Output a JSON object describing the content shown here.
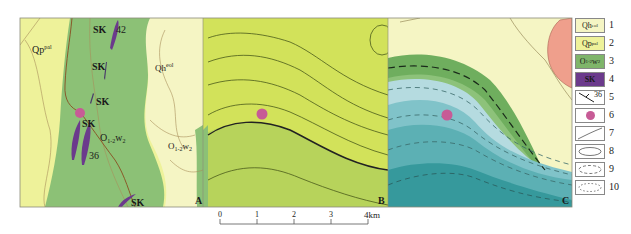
{
  "panels": [
    {
      "id": "A",
      "label": "A"
    },
    {
      "id": "B",
      "label": "B"
    },
    {
      "id": "C",
      "label": "C"
    }
  ],
  "panel_a": {
    "units": {
      "qp": {
        "base": "Qp",
        "sup": "pal"
      },
      "qh": {
        "base": "Qh",
        "sup": "eol"
      },
      "o1": {
        "base": "O",
        "sub": "1-2",
        "rest": "w",
        "sub2": "2"
      },
      "o2": {
        "base": "O",
        "sub": "1-2",
        "rest": "w",
        "sub2": "2"
      }
    },
    "skarn_labels": [
      "SK",
      "SK",
      "SK",
      "SK",
      "SK"
    ],
    "dip_values": [
      "42",
      "36"
    ]
  },
  "scale_bar": {
    "ticks": [
      "0",
      "1",
      "2",
      "3",
      "4km"
    ]
  },
  "legend": {
    "items": [
      {
        "num": "1",
        "symbol": "Qh",
        "sup": "eol",
        "color": "#f5f5c4"
      },
      {
        "num": "2",
        "symbol": "Qp",
        "sup": "pal",
        "color": "#eef29a"
      },
      {
        "num": "3",
        "symbol": "O",
        "sub": "1-2",
        "rest": "w",
        "sub2": "2",
        "color": "#7fb56a"
      },
      {
        "num": "4",
        "symbol": "SK",
        "color": "#6b3a8c"
      },
      {
        "num": "5",
        "symbol": "36",
        "desc": "strike-dip"
      },
      {
        "num": "6",
        "symbol": "",
        "desc": "sample point",
        "color": "#c75b96"
      },
      {
        "num": "7",
        "symbol": "",
        "desc": "geological boundary"
      },
      {
        "num": "8",
        "symbol": "",
        "desc": "solid contour"
      },
      {
        "num": "9",
        "symbol": "",
        "desc": "dashed contour"
      },
      {
        "num": "10",
        "symbol": "",
        "desc": "dotted contour"
      }
    ]
  },
  "colors": {
    "pale_yellow": "#f5f5c4",
    "yellow_qp": "#eef29a",
    "green_o": "#8cc176",
    "purple_sk": "#6b3a8c",
    "pink_dot": "#c75b96",
    "lime_b_top": "#d2e25a",
    "lime_b_bottom": "#b7d35b",
    "green_c_dark": "#6fae5e",
    "green_c_light": "#8dc27a",
    "blue_c_light": "#b5dbe0",
    "blue_c_mid": "#80c3c9",
    "teal_c": "#4fa9ae",
    "teal_c_dark": "#36999c",
    "salmon": "#ef9f8c"
  }
}
